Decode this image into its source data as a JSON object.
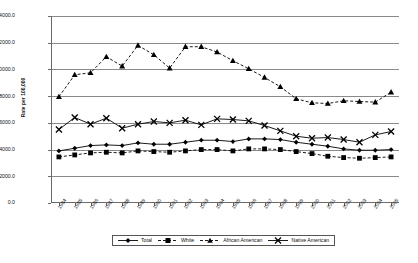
{
  "chart_data": {
    "type": "line",
    "title": "",
    "xlabel": "",
    "ylabel": "Rate per 100,000",
    "ylim": [
      0,
      14000
    ],
    "ytick_step": 2000,
    "grid": true,
    "legend_position": "bottom",
    "categories": [
      "1984",
      "1985",
      "1986",
      "1987",
      "1988",
      "1989",
      "1990",
      "1991",
      "1992",
      "1993",
      "1994",
      "1995",
      "1996",
      "1997",
      "1998",
      "1999",
      "2000",
      "2001",
      "2002",
      "2003",
      "2004",
      "2005"
    ],
    "series": [
      {
        "name": "Total",
        "marker": "diamond",
        "line_style": "solid",
        "values": [
          3900,
          4100,
          4300,
          4350,
          4300,
          4500,
          4400,
          4400,
          4550,
          4700,
          4700,
          4600,
          4800,
          4800,
          4750,
          4550,
          4400,
          4250,
          4050,
          3950,
          3950,
          4000
        ]
      },
      {
        "name": "White",
        "marker": "square",
        "line_style": "dashed",
        "values": [
          3450,
          3600,
          3750,
          3800,
          3750,
          3900,
          3850,
          3800,
          3900,
          4000,
          4000,
          3900,
          4050,
          4050,
          4000,
          3850,
          3700,
          3500,
          3400,
          3350,
          3400,
          3450
        ]
      },
      {
        "name": "African American",
        "marker": "triangle",
        "line_style": "dashed",
        "values": [
          7950,
          9600,
          9750,
          10950,
          10250,
          11800,
          11100,
          10100,
          11700,
          11700,
          11300,
          10650,
          10050,
          9400,
          8700,
          7800,
          7500,
          7450,
          7650,
          7600,
          7550,
          8300
        ]
      },
      {
        "name": "Native American",
        "marker": "x",
        "line_style": "solid",
        "values": [
          5500,
          6400,
          5900,
          6350,
          5600,
          5900,
          6100,
          6000,
          6200,
          5850,
          6300,
          6250,
          6150,
          5800,
          5400,
          5000,
          4850,
          4900,
          4750,
          4550,
          5100,
          5350
        ]
      }
    ]
  },
  "legend": {
    "items": [
      {
        "label": "Total",
        "marker": "diamond-icon"
      },
      {
        "label": "White",
        "marker": "square-icon"
      },
      {
        "label": "African American",
        "marker": "triangle-icon"
      },
      {
        "label": "Native American",
        "marker": "x-icon"
      }
    ]
  },
  "yaxis": {
    "ticks": [
      "14000.0",
      "12000.0",
      "10000.0",
      "8000.0",
      "6000.0",
      "4000.0",
      "2000.0",
      "0.0"
    ],
    "label": "Rate per 100,000"
  }
}
